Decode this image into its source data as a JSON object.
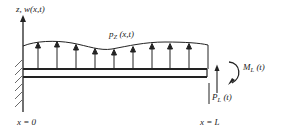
{
  "diagram": {
    "labels": {
      "axis": "z, w(x,t)",
      "distributed_load": "p",
      "distributed_load_sub": "Z",
      "distributed_load_args": " (x,t)",
      "moment": "M",
      "moment_sub": "L",
      "moment_args": " (t)",
      "tip_force": "P",
      "tip_force_sub": "L",
      "tip_force_args": " (t)",
      "left_position": "x = 0",
      "right_position": "x = L"
    },
    "colors": {
      "stroke": "#222222",
      "background": "#ffffff"
    },
    "load_arrow_x": [
      38,
      57,
      76,
      95,
      114,
      133,
      152,
      170,
      189
    ]
  }
}
